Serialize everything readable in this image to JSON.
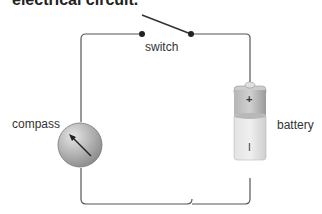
{
  "title": "electrical circuit.",
  "labels": {
    "switch": "switch",
    "compass": "compass",
    "battery": "battery"
  },
  "battery_marks": {
    "positive": "+",
    "negative": "I"
  },
  "colors": {
    "wire": "#555555",
    "battery_top": "#9a9a9a",
    "battery_bottom": "#d8d8d8",
    "compass": "#a8a8a8"
  }
}
